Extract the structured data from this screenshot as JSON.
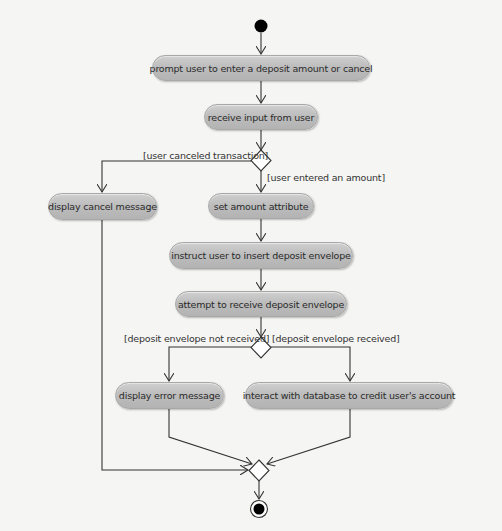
{
  "diagram": {
    "type": "UML activity diagram",
    "colors": {
      "background": "#f5f5f3",
      "node_fill": "#bdbdbd",
      "node_border": "#a8a8a8",
      "line": "#333333",
      "initial_node": "#000000"
    },
    "initial_node": {
      "icon": "initial-node-icon"
    },
    "final_node": {
      "icon": "final-node-icon"
    },
    "activities": [
      {
        "id": "prompt",
        "label": "prompt user to enter a deposit amount or cancel"
      },
      {
        "id": "receive_input",
        "label": "receive input from user"
      },
      {
        "id": "display_cancel",
        "label": "display cancel message"
      },
      {
        "id": "set_amount",
        "label": "set amount attribute"
      },
      {
        "id": "instruct_insert",
        "label": "instruct user to insert deposit envelope"
      },
      {
        "id": "attempt_receive",
        "label": "attempt to receive deposit envelope"
      },
      {
        "id": "display_error",
        "label": "display error message"
      },
      {
        "id": "credit_account",
        "label": "interact with database to credit user's account"
      }
    ],
    "decisions": [
      {
        "id": "decision_1",
        "guards": [
          "[user canceled transaction]",
          "[user entered an amount]"
        ]
      },
      {
        "id": "decision_2",
        "guards": [
          "[deposit envelope not received]",
          "[deposit envelope received]"
        ]
      }
    ],
    "merge": {
      "id": "merge_1"
    }
  }
}
